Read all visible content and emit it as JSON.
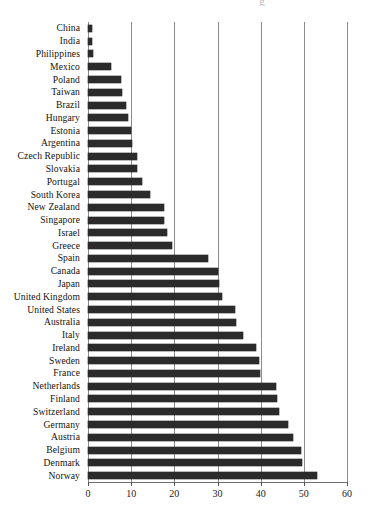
{
  "chart_data": {
    "type": "bar",
    "orientation": "horizontal",
    "title": "",
    "xlabel": "",
    "ylabel": "",
    "xlim": [
      0,
      60
    ],
    "xticks": [
      0,
      10,
      20,
      30,
      40,
      50,
      60
    ],
    "xtick_labels": [
      "0",
      "10",
      "20",
      "30",
      "40",
      "50",
      "60"
    ],
    "grid": "vertical",
    "legend": "none",
    "bar_color": "#2b2b2b",
    "categories": [
      "China",
      "India",
      "Philippines",
      "Mexico",
      "Poland",
      "Taiwan",
      "Brazil",
      "Hungary",
      "Estonia",
      "Argentina",
      "Czech Republic",
      "Slovakia",
      "Portugal",
      "South Korea",
      "New Zealand",
      "Singapore",
      "Israel",
      "Greece",
      "Spain",
      "Canada",
      "Japan",
      "United Kingdom",
      "United States",
      "Australia",
      "Italy",
      "Ireland",
      "Sweden",
      "France",
      "Netherlands",
      "Finland",
      "Switzerland",
      "Germany",
      "Austria",
      "Belgium",
      "Denmark",
      "Norway"
    ],
    "values": [
      1.0,
      1.0,
      1.2,
      5.4,
      7.7,
      7.9,
      8.7,
      9.2,
      9.9,
      10.1,
      11.3,
      11.4,
      12.4,
      14.4,
      17.5,
      17.6,
      18.4,
      19.5,
      27.8,
      30.0,
      30.4,
      31.1,
      34.0,
      34.3,
      35.9,
      38.9,
      39.7,
      39.8,
      43.5,
      43.7,
      44.2,
      46.4,
      47.4,
      49.4,
      49.5,
      53.0
    ]
  },
  "title_remnant": "g"
}
